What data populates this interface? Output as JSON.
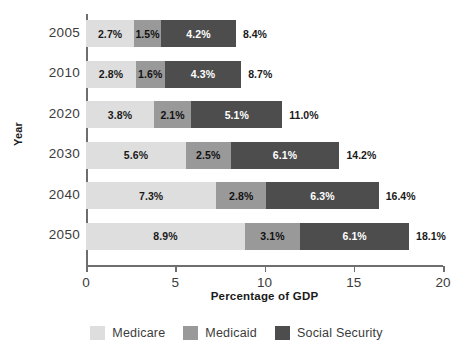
{
  "chart_data": {
    "type": "bar",
    "orientation": "horizontal",
    "stacked": true,
    "title": "",
    "xlabel": "Percentage of GDP",
    "ylabel": "Year",
    "categories": [
      "2005",
      "2010",
      "2020",
      "2030",
      "2040",
      "2050"
    ],
    "series": [
      {
        "name": "Medicare",
        "color": "#dedede",
        "values": [
          2.7,
          2.8,
          3.8,
          5.6,
          7.3,
          8.9
        ],
        "labels": [
          "2.7%",
          "2.8%",
          "3.8%",
          "5.6%",
          "7.3%",
          "8.9%"
        ]
      },
      {
        "name": "Medicaid",
        "color": "#999999",
        "values": [
          1.5,
          1.6,
          2.1,
          2.5,
          2.8,
          3.1
        ],
        "labels": [
          "1.5%",
          "1.6%",
          "2.1%",
          "2.5%",
          "2.8%",
          "3.1%"
        ]
      },
      {
        "name": "Social Security",
        "color": "#4d4d4d",
        "values": [
          4.2,
          4.3,
          5.1,
          6.1,
          6.3,
          6.1
        ],
        "labels": [
          "4.2%",
          "4.3%",
          "5.1%",
          "6.1%",
          "6.3%",
          "6.1%"
        ]
      }
    ],
    "totals": [
      8.4,
      8.7,
      11.0,
      14.2,
      16.4,
      18.1
    ],
    "total_labels": [
      "8.4%",
      "8.7%",
      "11.0%",
      "14.2%",
      "16.4%",
      "18.1%"
    ],
    "xlim": [
      0,
      20
    ],
    "xticks": [
      0,
      5,
      10,
      15,
      20
    ],
    "xtick_labels": [
      "0",
      "5",
      "10",
      "15",
      "20"
    ],
    "grid": false,
    "legend_position": "bottom"
  },
  "legend": {
    "items": [
      {
        "label": "Medicare",
        "color": "#dedede"
      },
      {
        "label": "Medicaid",
        "color": "#999999"
      },
      {
        "label": "Social Security",
        "color": "#4d4d4d"
      }
    ]
  }
}
